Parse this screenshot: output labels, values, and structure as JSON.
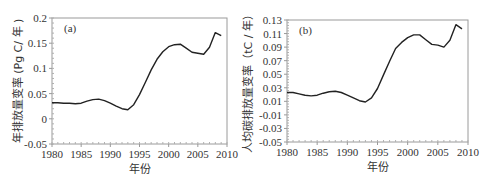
{
  "chart_data": [
    {
      "type": "line",
      "panel_label": "(a)",
      "title": "",
      "xlabel": "年份",
      "ylabel": "年排放量变率 (Pg C/ 年 )",
      "xlim": [
        1980,
        2010
      ],
      "ylim": [
        -0.05,
        0.2
      ],
      "xticks": [
        1980,
        1985,
        1990,
        1995,
        2000,
        2005,
        2010
      ],
      "yticks": [
        -0.05,
        0,
        0.05,
        0.1,
        0.15,
        0.2
      ],
      "ytick_labels": [
        "-0.05",
        "0",
        "0.05",
        "0.1",
        "0.15",
        "0.2"
      ],
      "grid": false,
      "series": [
        {
          "name": "年排放量变率",
          "x": [
            1980,
            1981,
            1982,
            1983,
            1984,
            1985,
            1986,
            1987,
            1988,
            1989,
            1990,
            1991,
            1992,
            1993,
            1994,
            1995,
            1996,
            1997,
            1998,
            1999,
            2000,
            2001,
            2002,
            2003,
            2004,
            2005,
            2006,
            2007,
            2008,
            2009
          ],
          "values": [
            0.032,
            0.032,
            0.031,
            0.031,
            0.03,
            0.031,
            0.035,
            0.038,
            0.039,
            0.036,
            0.031,
            0.025,
            0.02,
            0.018,
            0.028,
            0.048,
            0.072,
            0.097,
            0.118,
            0.133,
            0.143,
            0.147,
            0.148,
            0.14,
            0.132,
            0.13,
            0.128,
            0.142,
            0.171,
            0.165
          ]
        }
      ]
    },
    {
      "type": "line",
      "panel_label": "(b)",
      "title": "",
      "xlabel": "年份",
      "ylabel": "人均碳排放量变率（tC / 年）",
      "xlim": [
        1980,
        2010
      ],
      "ylim": [
        -0.05,
        0.13
      ],
      "xticks": [
        1980,
        1985,
        1990,
        1995,
        2000,
        2005,
        2010
      ],
      "yticks": [
        -0.05,
        -0.03,
        -0.01,
        0.01,
        0.03,
        0.05,
        0.07,
        0.09,
        0.11,
        0.13
      ],
      "ytick_labels": [
        "-0.05",
        "-0.03",
        "-0.01",
        "0.01",
        "0.03",
        "0.05",
        "0.07",
        "0.09",
        "0.11",
        "0.13"
      ],
      "grid": false,
      "series": [
        {
          "name": "人均碳排放量变率",
          "x": [
            1980,
            1981,
            1982,
            1983,
            1984,
            1985,
            1986,
            1987,
            1988,
            1989,
            1990,
            1991,
            1992,
            1993,
            1994,
            1995,
            1996,
            1997,
            1998,
            1999,
            2000,
            2001,
            2002,
            2003,
            2004,
            2005,
            2006,
            2007,
            2008,
            2009
          ],
          "values": [
            0.023,
            0.023,
            0.021,
            0.019,
            0.018,
            0.019,
            0.022,
            0.024,
            0.025,
            0.023,
            0.019,
            0.015,
            0.011,
            0.009,
            0.015,
            0.029,
            0.049,
            0.069,
            0.088,
            0.097,
            0.104,
            0.108,
            0.108,
            0.101,
            0.094,
            0.093,
            0.09,
            0.1,
            0.123,
            0.117
          ]
        }
      ]
    }
  ]
}
